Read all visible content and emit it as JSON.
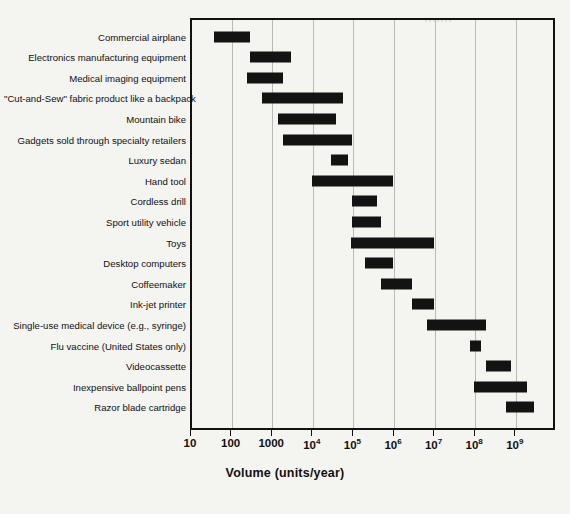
{
  "chart_data": {
    "type": "bar",
    "orientation": "horizontal",
    "subtype": "range-bar",
    "title": "",
    "xlabel": "Volume (units/year)",
    "ylabel": "",
    "xscale": "log",
    "xlim": [
      10,
      3000000000
    ],
    "grid": true,
    "legend": "none",
    "xticks": [
      10,
      100,
      1000,
      10000,
      100000,
      1000000,
      10000000,
      100000000,
      1000000000
    ],
    "xticklabels": [
      "10",
      "100",
      "1000",
      "10⁴",
      "10⁵",
      "10⁶",
      "10⁷",
      "10⁸",
      "10⁹"
    ],
    "xticklabel_parts": [
      {
        "base": "10",
        "exp": ""
      },
      {
        "base": "100",
        "exp": ""
      },
      {
        "base": "1000",
        "exp": ""
      },
      {
        "base": "10",
        "exp": "4"
      },
      {
        "base": "10",
        "exp": "5"
      },
      {
        "base": "10",
        "exp": "6"
      },
      {
        "base": "10",
        "exp": "7"
      },
      {
        "base": "10",
        "exp": "8"
      },
      {
        "base": "10",
        "exp": "9"
      }
    ],
    "categories": [
      "Commercial airplane",
      "Electronics manufacturing equipment",
      "Medical imaging equipment",
      "\"Cut-and-Sew\" fabric product like a backpack",
      "Mountain bike",
      "Gadgets sold through specialty retailers",
      "Luxury sedan",
      "Hand tool",
      "Cordless drill",
      "Sport utility vehicle",
      "Toys",
      "Desktop computers",
      "Coffeemaker",
      "Ink-jet printer",
      "Single-use medical device (e.g., syringe)",
      "Flu vaccine (United States only)",
      "Videocassette",
      "Inexpensive ballpoint pens",
      "Razor blade cartridge"
    ],
    "ranges": [
      {
        "label": "Commercial airplane",
        "low": 40,
        "high": 300
      },
      {
        "label": "Electronics manufacturing equipment",
        "low": 300,
        "high": 3000
      },
      {
        "label": "Medical imaging equipment",
        "low": 250,
        "high": 2000
      },
      {
        "label": "\"Cut-and-Sew\" fabric product like a backpack",
        "low": 600,
        "high": 60000
      },
      {
        "label": "Mountain bike",
        "low": 1500,
        "high": 40000
      },
      {
        "label": "Gadgets sold through specialty retailers",
        "low": 2000,
        "high": 100000
      },
      {
        "label": "Luxury sedan",
        "low": 30000,
        "high": 80000
      },
      {
        "label": "Hand tool",
        "low": 10000,
        "high": 1000000
      },
      {
        "label": "Cordless drill",
        "low": 100000,
        "high": 400000
      },
      {
        "label": "Sport utility vehicle",
        "low": 100000,
        "high": 500000
      },
      {
        "label": "Toys",
        "low": 90000,
        "high": 10000000
      },
      {
        "label": "Desktop computers",
        "low": 200000,
        "high": 1000000
      },
      {
        "label": "Coffeemaker",
        "low": 500000,
        "high": 3000000
      },
      {
        "label": "Ink-jet printer",
        "low": 3000000,
        "high": 10000000
      },
      {
        "label": "Single-use medical device (e.g., syringe)",
        "low": 7000000,
        "high": 200000000
      },
      {
        "label": "Flu vaccine (United States only)",
        "low": 80000000,
        "high": 150000000
      },
      {
        "label": "Videocassette",
        "low": 200000000,
        "high": 800000000
      },
      {
        "label": "Inexpensive ballpoint pens",
        "low": 100000000,
        "high": 2000000000
      },
      {
        "label": "Razor blade cartridge",
        "low": 600000000,
        "high": 3000000000
      }
    ],
    "colors": {
      "bar": "#131313",
      "grid": "#b9b9b6",
      "axis": "#111111",
      "background": "#f4f4f1"
    }
  }
}
